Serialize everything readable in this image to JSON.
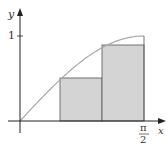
{
  "chart_data": {
    "type": "area",
    "title": "",
    "xlabel": "x",
    "ylabel": "y",
    "x_ticks": [
      "π/2"
    ],
    "y_ticks": [
      "1"
    ],
    "xlim": [
      0,
      1.5708
    ],
    "ylim": [
      0,
      1
    ],
    "curve": {
      "function": "sin(x)",
      "x": [
        0,
        0.2618,
        0.5236,
        0.7854,
        1.0472,
        1.309,
        1.5708
      ],
      "y": [
        0,
        0.2588,
        0.5,
        0.7071,
        0.866,
        0.9659,
        1.0
      ]
    },
    "rectangles": [
      {
        "x0": 0,
        "x1": 0.5236,
        "height": 0
      },
      {
        "x0": 0.5236,
        "x1": 1.0472,
        "height": 0.5
      },
      {
        "x0": 1.0472,
        "x1": 1.5708,
        "height": 0.866
      }
    ],
    "grid": false,
    "legend": null
  },
  "labels": {
    "y_axis": "y",
    "x_axis": "x",
    "y_tick": "1",
    "x_tick_num": "π",
    "x_tick_den": "2"
  },
  "colors": {
    "curve": "#a8a8a8",
    "rect_fill": "#d4d4d4",
    "rect_stroke": "#555555",
    "axis": "#222222"
  }
}
